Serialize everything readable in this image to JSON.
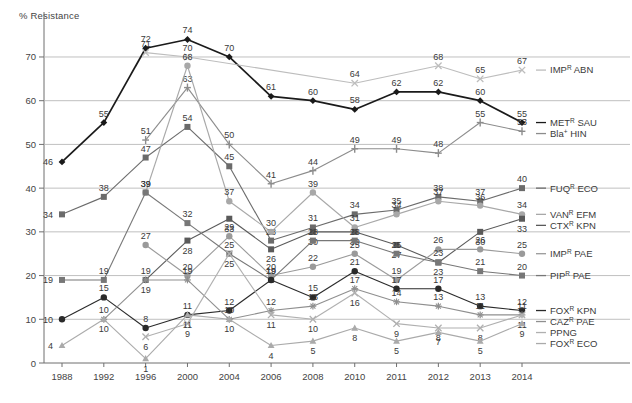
{
  "chart_data": {
    "type": "line",
    "title": "",
    "ylabel": "% Resistance",
    "xlabel": "",
    "ylim": [
      0,
      78
    ],
    "yticks": [
      0,
      10,
      20,
      30,
      40,
      50,
      60,
      70
    ],
    "grid": "horizontal",
    "legend_position": "right",
    "categories": [
      "1988",
      "1992",
      "1996",
      "2000",
      "2004",
      "2006",
      "2008",
      "2010",
      "2011",
      "2012",
      "2013",
      "2014"
    ],
    "series": [
      {
        "name": "METᴿ SAU",
        "base": "MET",
        "sup": "R",
        "organism": "SAU",
        "marker": "diamond",
        "color": "#1a1a1a",
        "values": [
          46,
          55,
          72,
          74,
          70,
          61,
          60,
          58,
          62,
          62,
          60,
          55
        ],
        "labels": [
          "46",
          "55",
          "72",
          "74",
          "70",
          "61",
          "60",
          "58",
          "62",
          "62",
          "60",
          "55"
        ]
      },
      {
        "name": "IMPᴿ ABN",
        "base": "IMP",
        "sup": "R",
        "organism": "ABN",
        "marker": "cross-light",
        "color": "#bdbdbd",
        "values": [
          null,
          null,
          71,
          70,
          null,
          null,
          null,
          64,
          null,
          68,
          65,
          67
        ],
        "labels": [
          null,
          null,
          "71",
          "70",
          null,
          null,
          null,
          "64",
          null,
          "68",
          "65",
          "67"
        ]
      },
      {
        "name": "Bla⁺ HIN",
        "base": "Bla",
        "sup": "+",
        "organism": "HIN",
        "marker": "plus",
        "color": "#8c8c8c",
        "values": [
          null,
          null,
          51,
          63,
          50,
          41,
          44,
          49,
          49,
          48,
          55,
          53
        ],
        "labels": [
          null,
          null,
          "51",
          "63",
          "50",
          "41",
          "44",
          "49",
          "49",
          "48",
          "55",
          "53"
        ]
      },
      {
        "name": "FUQᴿ ECO",
        "base": "FUQ",
        "sup": "R",
        "organism": "ECO",
        "marker": "square",
        "color": "#6b6b6b",
        "values": [
          34,
          38,
          47,
          54,
          45,
          28,
          31,
          34,
          35,
          38,
          37,
          40
        ],
        "labels": [
          "34",
          "38",
          "47",
          "54",
          "45",
          "28",
          "31",
          "34",
          "35",
          "38",
          "37",
          "40"
        ]
      },
      {
        "name": "VANᴿ EFM",
        "base": "VAN",
        "sup": "R",
        "organism": "EFM",
        "marker": "circle-light",
        "color": "#a8a8a8",
        "values": [
          null,
          null,
          39,
          68,
          37,
          30,
          39,
          31,
          34,
          37,
          36,
          34
        ],
        "labels": [
          null,
          null,
          "39",
          "68",
          "37",
          "30",
          "39",
          "31",
          "34",
          "37",
          "36",
          "34"
        ]
      },
      {
        "name": "CTXᴿ KPN",
        "base": "CTX",
        "sup": "R",
        "organism": "KPN",
        "marker": "square-dark",
        "color": "#5a5a5a",
        "values": [
          null,
          null,
          19,
          28,
          33,
          26,
          30,
          30,
          27,
          23,
          30,
          33
        ],
        "labels": [
          null,
          null,
          "19",
          "28",
          "33",
          "26",
          "30",
          "30",
          "27",
          "23",
          "30",
          "33"
        ]
      },
      {
        "name": "IMPᴿ PAE",
        "base": "IMP",
        "sup": "R",
        "organism": "PAE",
        "marker": "circle-gray",
        "color": "#9a9a9a",
        "values": [
          null,
          null,
          27,
          20,
          29,
          20,
          22,
          25,
          19,
          26,
          26,
          25
        ],
        "labels": [
          null,
          null,
          "27",
          "20",
          "29",
          "20",
          "22",
          "25",
          "19",
          "26",
          "26",
          "25"
        ]
      },
      {
        "name": "PIPᴿ PAE",
        "base": "PIP",
        "sup": "R",
        "organism": "PAE",
        "marker": "square-mid",
        "color": "#777777",
        "values": [
          19,
          19,
          39,
          32,
          25,
          19,
          28,
          28,
          25,
          23,
          21,
          20
        ],
        "labels": [
          "19",
          "19",
          "39",
          "32",
          "25",
          "19",
          "28",
          "28",
          "25",
          "23",
          "21",
          "20"
        ]
      },
      {
        "name": "FOXᴿ KPN",
        "base": "FOX",
        "sup": "R",
        "organism": "KPN",
        "marker": "circle-dark",
        "color": "#2a2a2a",
        "values": [
          10,
          15,
          8,
          11,
          12,
          19,
          15,
          21,
          17,
          17,
          13,
          12
        ],
        "labels": [
          "10",
          "15",
          "8",
          "11",
          "12",
          "19",
          "15",
          "21",
          "17",
          "17",
          "13",
          "12"
        ]
      },
      {
        "name": "CAZᴿ PAE",
        "base": "CAZ",
        "sup": "R",
        "organism": "PAE",
        "marker": "star",
        "color": "#8f8f8f",
        "values": [
          null,
          10,
          19,
          19,
          10,
          12,
          13,
          17,
          14,
          13,
          11,
          11
        ],
        "labels": [
          null,
          "10",
          "19",
          "19",
          "10",
          "12",
          "13",
          "17",
          "14",
          "13",
          "11",
          "11"
        ]
      },
      {
        "name": "PPNG",
        "base": "PPNG",
        "sup": "",
        "organism": "",
        "marker": "cross-x",
        "color": "#b0b0b0",
        "values": [
          null,
          null,
          6,
          9,
          25,
          11,
          10,
          16,
          9,
          8,
          8,
          11
        ],
        "labels": [
          null,
          null,
          "6",
          "9",
          "25",
          "11",
          "10",
          "16",
          "9",
          "8",
          "8",
          "11"
        ]
      },
      {
        "name": "FOXᴿ ECO",
        "base": "FOX",
        "sup": "R",
        "organism": "ECO",
        "marker": "triangle",
        "color": "#aaaaaa",
        "values": [
          4,
          10,
          1,
          11,
          10,
          4,
          5,
          8,
          5,
          7,
          5,
          9
        ],
        "labels": [
          "4",
          "10",
          "1",
          "11",
          "10",
          "4",
          "5",
          "8",
          "5",
          "7",
          "5",
          "9"
        ]
      }
    ]
  },
  "axis": {
    "ylabel_text": "% Resistance",
    "yticks": [
      "70",
      "60",
      "50",
      "40",
      "30",
      "20",
      "10",
      "0"
    ],
    "xticks": [
      "1988",
      "1992",
      "1996",
      "2000",
      "2004",
      "2006",
      "2008",
      "2010",
      "2011",
      "2012",
      "2013",
      "2014"
    ]
  },
  "legend": {
    "entries": [
      {
        "label": "IMPᴿ ABN",
        "base": "IMP",
        "sup": "R",
        "tail": " ABN"
      },
      {
        "label": "METᴿ SAU",
        "base": "MET",
        "sup": "R",
        "tail": " SAU"
      },
      {
        "label": "Bla⁺ HIN",
        "base": "Bla",
        "sup": "+",
        "tail": " HIN"
      },
      {
        "label": "FUQᴿ ECO",
        "base": "FUQ",
        "sup": "R",
        "tail": " ECO"
      },
      {
        "label": "VANᴿ EFM",
        "base": "VAN",
        "sup": "R",
        "tail": " EFM"
      },
      {
        "label": "CTXᴿ KPN",
        "base": "CTX",
        "sup": "R",
        "tail": " KPN"
      },
      {
        "label": "IMPᴿ PAE",
        "base": "IMP",
        "sup": "R",
        "tail": " PAE"
      },
      {
        "label": "PIPᴿ PAE",
        "base": "PIP",
        "sup": "R",
        "tail": " PAE"
      },
      {
        "label": "FOXᴿ KPN",
        "base": "FOX",
        "sup": "R",
        "tail": " KPN"
      },
      {
        "label": "CAZᴿ PAE",
        "base": "CAZ",
        "sup": "R",
        "tail": " PAE"
      },
      {
        "label": "PPNG",
        "base": "PPNG",
        "sup": "",
        "tail": ""
      },
      {
        "label": "FOXᴿ ECO",
        "base": "FOX",
        "sup": "R",
        "tail": " ECO"
      }
    ]
  }
}
